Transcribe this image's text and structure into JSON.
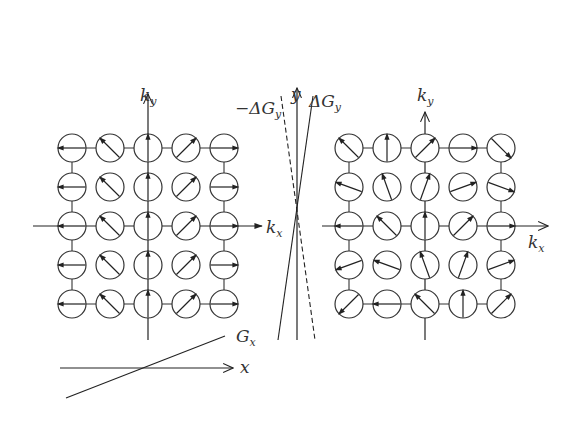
{
  "figure": {
    "left_panel": {
      "axis_labels": {
        "ky": "k",
        "ky_sub": "y",
        "kx": "k",
        "kx_sub": "x"
      },
      "grid": {
        "rows": 5,
        "cols": 5,
        "arrow_angles_deg": [
          [
            180,
            135,
            90,
            45,
            0
          ],
          [
            180,
            135,
            90,
            45,
            0
          ],
          [
            180,
            135,
            90,
            45,
            0
          ],
          [
            180,
            135,
            90,
            45,
            0
          ],
          [
            180,
            135,
            90,
            45,
            0
          ]
        ]
      }
    },
    "middle_panel": {
      "axis_label": "y",
      "solid_line_label": "ΔG",
      "solid_line_sub": "y",
      "dashed_line_label": "−ΔG",
      "dashed_line_sub": "y"
    },
    "bottom_panel": {
      "axis_label": "x",
      "line_label": "G",
      "line_sub": "x"
    },
    "right_panel": {
      "axis_labels": {
        "ky": "k",
        "ky_sub": "y",
        "kx": "k",
        "kx_sub": "x"
      },
      "grid": {
        "rows": 5,
        "cols": 5,
        "arrow_angles_deg": [
          [
            135,
            90,
            45,
            0,
            -45
          ],
          [
            160,
            110,
            70,
            20,
            -20
          ],
          [
            180,
            135,
            90,
            45,
            0
          ],
          [
            -160,
            160,
            110,
            70,
            20
          ],
          [
            -135,
            180,
            135,
            90,
            45
          ]
        ]
      }
    }
  }
}
